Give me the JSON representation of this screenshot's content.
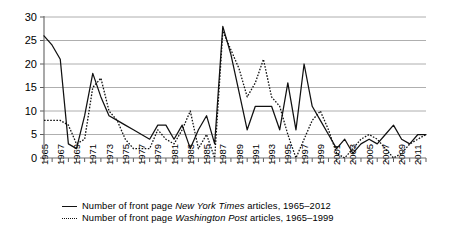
{
  "chart_data": {
    "type": "line",
    "title": "",
    "xlabel": "",
    "ylabel": "",
    "ylim": [
      0,
      30
    ],
    "xlim": [
      1965,
      2012
    ],
    "ytick_labels": [
      "0",
      "5",
      "10",
      "15",
      "20",
      "25",
      "30"
    ],
    "ytick_values": [
      0,
      5,
      10,
      15,
      20,
      25,
      30
    ],
    "grid": true,
    "legend_position": "below",
    "x": [
      1965,
      1966,
      1967,
      1968,
      1969,
      1970,
      1971,
      1972,
      1973,
      1974,
      1975,
      1976,
      1977,
      1978,
      1979,
      1980,
      1981,
      1982,
      1983,
      1984,
      1985,
      1986,
      1987,
      1988,
      1989,
      1990,
      1991,
      1992,
      1993,
      1994,
      1995,
      1996,
      1997,
      1998,
      1999,
      2000,
      2001,
      2002,
      2003,
      2004,
      2005,
      2006,
      2007,
      2008,
      2009,
      2010,
      2011,
      2012
    ],
    "xtick_labels": [
      "1965",
      "1967",
      "1969",
      "1971",
      "1973",
      "1975",
      "1977",
      "1979",
      "1981",
      "1983",
      "1985",
      "1987",
      "1989",
      "1991",
      "1993",
      "1995",
      "1997",
      "1999",
      "2001",
      "2003",
      "2005",
      "2007",
      "2009",
      "2011"
    ],
    "series": [
      {
        "name": "Number of front page New York Times articles, 1965–2012",
        "style": "solid",
        "x_start": 1965,
        "values": [
          26,
          24,
          21,
          3,
          2,
          9,
          18,
          13,
          9,
          8,
          7,
          6,
          5,
          4,
          7,
          7,
          4,
          7,
          2,
          6,
          9,
          3,
          28,
          22,
          14,
          6,
          11,
          11,
          11,
          6,
          16,
          6,
          20,
          11,
          8,
          5,
          2,
          4,
          1,
          3,
          4,
          3,
          5,
          7,
          4,
          3,
          5,
          5
        ]
      },
      {
        "name": "Number of front page Washington Post articles, 1965–1999",
        "style": "dotted",
        "x_start": 1965,
        "values": [
          8,
          8,
          8,
          7,
          3,
          4,
          15,
          17,
          10,
          8,
          4,
          2,
          2,
          2,
          6,
          4,
          3,
          6,
          10,
          2,
          5,
          0,
          27,
          23,
          19,
          13,
          16,
          21,
          13,
          11,
          5,
          0,
          4,
          8,
          10,
          6,
          1,
          0,
          2,
          4,
          5,
          4,
          2,
          0,
          1,
          3,
          4,
          5
        ]
      }
    ]
  },
  "legend": {
    "items": [
      {
        "icon": "solid-line-swatch",
        "prefix": "Number of front page ",
        "source": "New York Times",
        "suffix": " articles, 1965–2012"
      },
      {
        "icon": "dotted-line-swatch",
        "prefix": "Number of front page ",
        "source": "Washington Post",
        "suffix": " articles, 1965–1999"
      }
    ]
  }
}
